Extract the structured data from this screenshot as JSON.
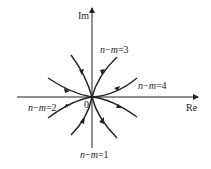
{
  "diagram": {
    "title": "",
    "axes": {
      "real_label": "Re",
      "imag_label": "Im",
      "origin_label": "0"
    },
    "branches": [
      {
        "label_n": "n",
        "label_m": "m",
        "label_eq": "=1",
        "direction": "down"
      },
      {
        "label_n": "n",
        "label_m": "m",
        "label_eq": "=2",
        "direction": "left"
      },
      {
        "label_n": "n",
        "label_m": "m",
        "label_eq": "=3",
        "direction": "up"
      },
      {
        "label_n": "n",
        "label_m": "m",
        "label_eq": "=4",
        "direction": "right"
      }
    ],
    "colors": {
      "stroke": "#222222",
      "background": "#ffffff"
    }
  }
}
